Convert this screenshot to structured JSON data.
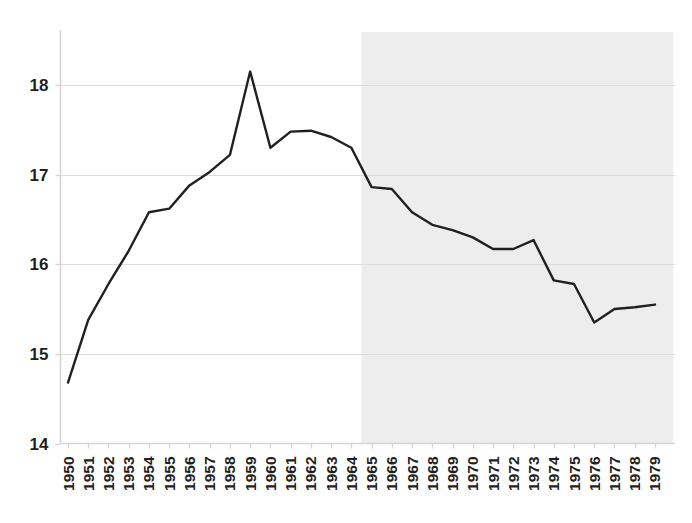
{
  "chart_data": {
    "type": "line",
    "title": "",
    "subtitle": "",
    "xlabel": "",
    "ylabel": "",
    "x": [
      1950,
      1951,
      1952,
      1953,
      1954,
      1955,
      1956,
      1957,
      1958,
      1959,
      1960,
      1961,
      1962,
      1963,
      1964,
      1965,
      1966,
      1967,
      1968,
      1969,
      1970,
      1971,
      1972,
      1973,
      1974,
      1975,
      1976,
      1977,
      1978,
      1979
    ],
    "categories": [
      "1950",
      "1951",
      "1952",
      "1953",
      "1954",
      "1955",
      "1956",
      "1957",
      "1958",
      "1959",
      "1960",
      "1961",
      "1962",
      "1963",
      "1964",
      "1965",
      "1966",
      "1967",
      "1968",
      "1969",
      "1970",
      "1971",
      "1972",
      "1973",
      "1974",
      "1975",
      "1976",
      "1977",
      "1978",
      "1979"
    ],
    "values": [
      14.68,
      15.38,
      15.78,
      16.15,
      16.58,
      16.62,
      16.88,
      17.03,
      17.22,
      18.15,
      17.3,
      17.48,
      17.49,
      17.42,
      17.3,
      16.86,
      16.84,
      16.58,
      16.44,
      16.38,
      16.3,
      16.17,
      16.17,
      16.27,
      15.82,
      15.78,
      15.35,
      15.5,
      15.52,
      15.55
    ],
    "series": [
      {
        "name": "series-1",
        "values": [
          14.68,
          15.38,
          15.78,
          16.15,
          16.58,
          16.62,
          16.88,
          17.03,
          17.22,
          18.15,
          17.3,
          17.48,
          17.49,
          17.42,
          17.3,
          16.86,
          16.84,
          16.58,
          16.44,
          16.38,
          16.3,
          16.17,
          16.17,
          16.27,
          15.82,
          15.78,
          15.35,
          15.5,
          15.52,
          15.55
        ],
        "color": "#231f20"
      }
    ],
    "ylim": [
      14,
      18.6
    ],
    "xlim": [
      1950,
      1979
    ],
    "yticks": [
      14,
      15,
      16,
      17,
      18
    ],
    "ytick_labels": [
      "14",
      "15",
      "16",
      "17",
      "18"
    ],
    "grid": true,
    "grid_axis": "y",
    "legend": false,
    "legend_position": "none",
    "annotations": [],
    "shaded_region": {
      "label": "",
      "x_start": 1964.5,
      "x_end": 1979.9,
      "color": "#ededed"
    },
    "colors": {
      "line": "#231f20",
      "grid": "#dcdcdc",
      "axis": "#d5d5d5",
      "shading": "#ededed",
      "tick_text": "#231f20",
      "background": "#ffffff"
    }
  },
  "axis": {
    "y_tick_labels": [
      "18",
      "17",
      "16",
      "15",
      "14"
    ],
    "x_tick_labels": [
      "1950",
      "1951",
      "1952",
      "1953",
      "1954",
      "1955",
      "1956",
      "1957",
      "1958",
      "1959",
      "1960",
      "1961",
      "1962",
      "1963",
      "1964",
      "1965",
      "1966",
      "1967",
      "1968",
      "1969",
      "1970",
      "1971",
      "1972",
      "1973",
      "1974",
      "1975",
      "1976",
      "1977",
      "1978",
      "1979"
    ]
  }
}
